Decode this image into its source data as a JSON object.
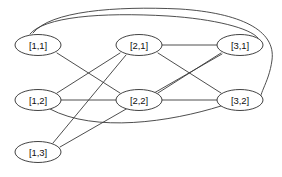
{
  "diagram": {
    "background_color": "#ffffff",
    "node_fill_color": "#ffffff",
    "node_stroke_color": "#2e2e2e",
    "edge_color": "#3a3a3a",
    "label_color": "#111111",
    "node_shape": "ellipse",
    "nodes": [
      {
        "id": "n11",
        "label": "[1,1]",
        "cx": 38,
        "cy": 45,
        "rx": 23,
        "ry": 10.5
      },
      {
        "id": "n21",
        "label": "[2,1]",
        "cx": 139,
        "cy": 45,
        "rx": 23,
        "ry": 10.5
      },
      {
        "id": "n31",
        "label": "[3,1]",
        "cx": 240,
        "cy": 45,
        "rx": 23,
        "ry": 10.5
      },
      {
        "id": "n12",
        "label": "[1,2]",
        "cx": 38,
        "cy": 100,
        "rx": 23,
        "ry": 10.5
      },
      {
        "id": "n22",
        "label": "[2,2]",
        "cx": 139,
        "cy": 100,
        "rx": 23,
        "ry": 10.5
      },
      {
        "id": "n32",
        "label": "[3,2]",
        "cx": 240,
        "cy": 100,
        "rx": 23,
        "ry": 10.5
      },
      {
        "id": "n13",
        "label": "[1,3]",
        "cx": 38,
        "cy": 152,
        "rx": 23,
        "ry": 10.5
      }
    ],
    "edges": [
      {
        "id": "e-21-31",
        "from": "[2,1]",
        "to": "[3,1]",
        "path": "M 162 45 L 217 45"
      },
      {
        "id": "e-12-22",
        "from": "[1,2]",
        "to": "[2,2]",
        "path": "M 61 100 L 116 100"
      },
      {
        "id": "e-22-32",
        "from": "[2,2]",
        "to": "[3,2]",
        "path": "M 162 100 L 217 100"
      },
      {
        "id": "e-11-22",
        "from": "[1,1]",
        "to": "[2,2]",
        "path": "M 57 53 L 120 93"
      },
      {
        "id": "e-12-21",
        "from": "[1,2]",
        "to": "[2,1]",
        "path": "M 57 93 L 120 53"
      },
      {
        "id": "e-21-32",
        "from": "[2,1]",
        "to": "[3,2]",
        "path": "M 158 53 L 221 93"
      },
      {
        "id": "e-22-31",
        "from": "[2,2]",
        "to": "[3,1]",
        "path": "M 158 93 L 221 53"
      },
      {
        "id": "e-13-21",
        "from": "[1,3]",
        "to": "[2,1]",
        "path": "M 53 143 L 126 55"
      },
      {
        "id": "e-13-31",
        "from": "[1,3]",
        "to": "[3,1]",
        "path": "M 60 147 L 222 54"
      },
      {
        "id": "e-12-32-curve",
        "from": "[1,2]",
        "to": "[3,2]",
        "path": "M 50 109 C 95 133 170 122 221 106"
      },
      {
        "id": "e-11-31-arc",
        "from": "[1,1]",
        "to": "[3,1]",
        "path": "M 30 34 C 44 17 100 12 168 16 C 214 19 250 28 258 38"
      },
      {
        "id": "e-11-32-arc",
        "from": "[1,1]",
        "to": "[3,2]",
        "path": "M 33 33 C 50 11 115 6 180 9 C 240 13 276 30 272 60 C 269 84 256 97 262 101"
      }
    ]
  }
}
